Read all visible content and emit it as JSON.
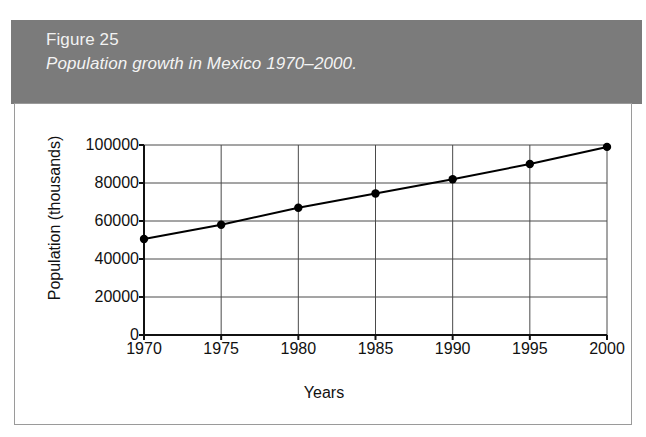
{
  "figure": {
    "number_label": "Figure 25",
    "caption": "Population growth in Mexico 1970–2000.",
    "band_color": "#7b7b7b",
    "caption_text_color": "#f2f2f2",
    "card_background": "#ffffff",
    "card_border_color": "#9a9a9a"
  },
  "chart_data": {
    "type": "line",
    "title": "Population growth in Mexico 1970–2000.",
    "xlabel": "Years",
    "ylabel": "Population (thousands)",
    "x": [
      1970,
      1975,
      1980,
      1985,
      1990,
      1995,
      2000
    ],
    "xtick_labels": [
      "1970",
      "1975",
      "1980",
      "1985",
      "1990",
      "1995",
      "2000"
    ],
    "values": [
      50500,
      58000,
      67000,
      74500,
      82000,
      90000,
      99000
    ],
    "ytick_values": [
      0,
      20000,
      40000,
      60000,
      80000,
      100000
    ],
    "ytick_labels": [
      "0",
      "20000",
      "40000",
      "60000",
      "80000",
      "100000"
    ],
    "xlim": [
      1970,
      2000
    ],
    "ylim": [
      0,
      100000
    ],
    "grid": true,
    "grid_color": "#4a4a4a",
    "line_color": "#000000",
    "marker": "circle",
    "marker_color": "#000000",
    "legend": null
  }
}
